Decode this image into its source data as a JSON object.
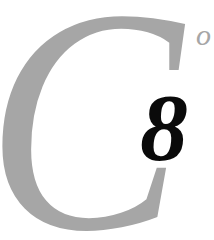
{
  "chapter_heading": {
    "initial_letter": "C",
    "trailing_letter": "o",
    "number": "8",
    "colors": {
      "initial": "#a6a6a6",
      "number": "#0a0a0a",
      "background": "#ffffff"
    }
  }
}
